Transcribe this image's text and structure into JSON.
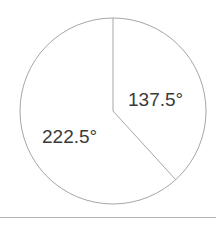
{
  "figure": {
    "type": "pie-sector-angle-diagram",
    "background_color": "#ffffff",
    "stroke_color": "#a6a6a6",
    "text_color": "#3a3a3a",
    "divider_color": "#b5b5b5",
    "circle": {
      "center_x": 113,
      "center_y": 111,
      "radius": 93
    },
    "radii": [
      {
        "name": "radius-up",
        "angle_from_top_deg": 0,
        "end_x": 113,
        "end_y": 18
      },
      {
        "name": "radius-lower-right",
        "angle_from_top_deg": 137.5,
        "end_x": 176,
        "end_y": 180
      }
    ],
    "labels": {
      "right_sector": "137.5°",
      "left_sector": "222.5°"
    }
  },
  "chart_data": {
    "type": "pie",
    "title": "",
    "subtitle": "",
    "xlabel": "",
    "ylabel": "",
    "categories": [
      "Right sector",
      "Left sector"
    ],
    "values": [
      137.5,
      222.5
    ],
    "units": "degrees",
    "total": 360,
    "data_labels": [
      "137.5°",
      "222.5°"
    ],
    "legend": [],
    "legend_position": "none",
    "grid": false,
    "annotations": [
      {
        "text": "137.5°",
        "x": 128,
        "y": 90,
        "describes": "angle of the smaller right-hand sector"
      },
      {
        "text": "222.5°",
        "x": 42,
        "y": 127,
        "describes": "angle of the larger left-hand sector"
      }
    ]
  }
}
